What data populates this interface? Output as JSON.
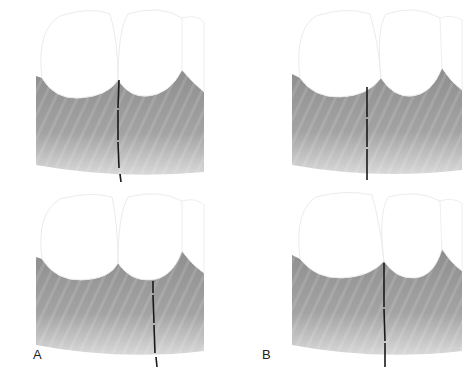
{
  "figure": {
    "panels": [
      {
        "id": "A-top",
        "probe_x": 118,
        "probe_top": 80,
        "probe_bottom": 183,
        "probe_tilt": 4,
        "crest_x": 118
      },
      {
        "id": "B-top",
        "probe_x": 131,
        "probe_top": 87,
        "probe_bottom": 180,
        "probe_tilt": 0,
        "crest_x": 145
      },
      {
        "id": "A-bottom",
        "probe_x": 153,
        "probe_top": 92,
        "probe_bottom": 178,
        "probe_tilt": 4,
        "crest_x": 118
      },
      {
        "id": "B-bottom",
        "probe_x": 148,
        "probe_top": 76,
        "probe_bottom": 176,
        "probe_tilt": 0,
        "crest_x": 145
      }
    ],
    "labels": {
      "a": "A",
      "b": "B"
    },
    "colors": {
      "gingiva": "#9a9a9a",
      "gingiva_light": "#c8c8c8",
      "tooth": "#ffffff",
      "tooth_outline": "#e2e2e2",
      "probe": "#1a1a1a"
    }
  }
}
